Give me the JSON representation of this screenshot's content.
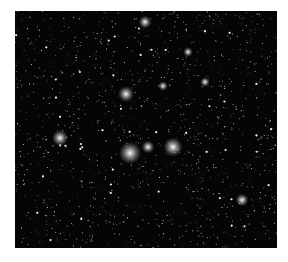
{
  "image": {
    "subject": "deep field astronomical image of stars and galaxies",
    "background_color": "#050505",
    "frame_color": "#ffffff",
    "bright_objects": [
      {
        "x": 130,
        "y": 153,
        "r": 7
      },
      {
        "x": 148,
        "y": 147,
        "r": 4
      },
      {
        "x": 173,
        "y": 147,
        "r": 6
      },
      {
        "x": 126,
        "y": 94,
        "r": 5
      },
      {
        "x": 60,
        "y": 138,
        "r": 5
      },
      {
        "x": 145,
        "y": 22,
        "r": 4
      },
      {
        "x": 242,
        "y": 200,
        "r": 4
      },
      {
        "x": 205,
        "y": 82,
        "r": 3
      },
      {
        "x": 163,
        "y": 86,
        "r": 3
      },
      {
        "x": 188,
        "y": 52,
        "r": 3
      }
    ]
  }
}
